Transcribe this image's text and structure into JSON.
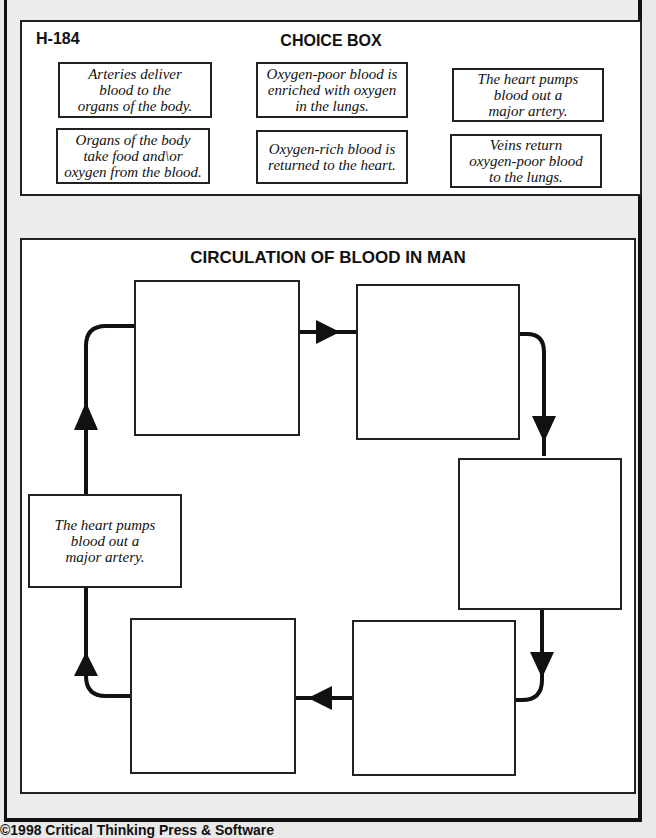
{
  "worksheet": {
    "code": "H-184",
    "choice_box": {
      "title": "CHOICE BOX",
      "choices": [
        "Arteries deliver\nblood to the\norgans of the body.",
        "Oxygen-poor blood is\nenriched with oxygen\nin the lungs.",
        "The heart pumps\nblood out a\nmajor artery.",
        "Organs of the body\ntake food and\\or\noxygen from the blood.",
        "Oxygen-rich blood is\nreturned to the heart.",
        "Veins return\noxygen-poor blood\nto the lungs."
      ]
    },
    "diagram": {
      "title": "CIRCULATION OF BLOOD IN MAN",
      "boxes": [
        {
          "position": "left-middle",
          "text": "The heart pumps\nblood out a\nmajor artery."
        },
        {
          "position": "top-left",
          "text": ""
        },
        {
          "position": "top-right",
          "text": ""
        },
        {
          "position": "right-middle",
          "text": ""
        },
        {
          "position": "bottom-right",
          "text": ""
        },
        {
          "position": "bottom-left",
          "text": ""
        }
      ],
      "flow_direction": "clockwise"
    },
    "footer": "©1998 Critical Thinking Press & Software"
  }
}
